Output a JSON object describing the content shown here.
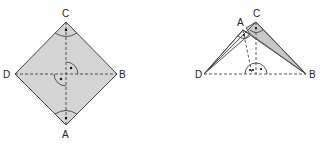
{
  "figure_left": {
    "title": "Square ABCD folded view (top)",
    "labels": {
      "C": "C",
      "D": "D",
      "B": "B",
      "A": "A"
    },
    "fill": "#d4d4d4",
    "stroke": "#444444"
  },
  "figure_right": {
    "title": "Folded along diagonal",
    "labels": {
      "A": "A",
      "C": "C",
      "D": "D",
      "B": "B"
    },
    "fill": "#c8c8c8",
    "stroke": "#444444"
  }
}
